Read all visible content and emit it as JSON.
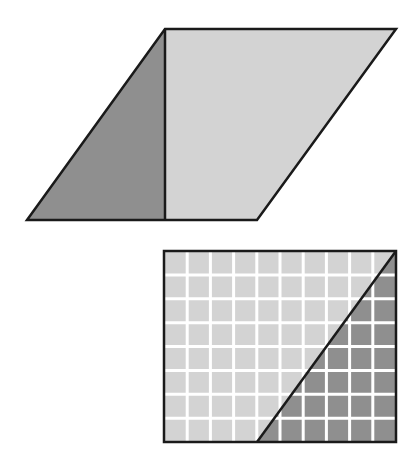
{
  "figure": {
    "width": 415,
    "height": 470,
    "background": "#ffffff"
  },
  "colors": {
    "stroke": "#1a1a1a",
    "light_fill": "#d3d3d3",
    "dark_fill": "#8f8f8f",
    "grid_line": "#ffffff"
  },
  "parallelogram": {
    "vertices": [
      [
        165,
        29
      ],
      [
        396,
        29
      ],
      [
        257,
        220
      ],
      [
        27,
        220
      ]
    ],
    "height_line": {
      "x": 165,
      "y1": 29,
      "y2": 220
    },
    "left_triangle": {
      "points": [
        [
          27,
          220
        ],
        [
          165,
          29
        ],
        [
          165,
          220
        ]
      ],
      "fill": "dark"
    },
    "right_region": {
      "points": [
        [
          165,
          29
        ],
        [
          396,
          29
        ],
        [
          257,
          220
        ],
        [
          165,
          220
        ]
      ],
      "fill": "light"
    }
  },
  "grid_rectangle": {
    "x": 164,
    "y": 251,
    "width": 232,
    "height": 191,
    "columns": 10,
    "rows": 8,
    "diagonal": {
      "x1": 257,
      "y1": 442,
      "x2": 396,
      "y2": 251
    },
    "light_region": {
      "points": [
        [
          164,
          251
        ],
        [
          396,
          251
        ],
        [
          257,
          442
        ],
        [
          164,
          442
        ]
      ]
    },
    "dark_region": {
      "points": [
        [
          396,
          251
        ],
        [
          396,
          442
        ],
        [
          257,
          442
        ]
      ]
    }
  }
}
